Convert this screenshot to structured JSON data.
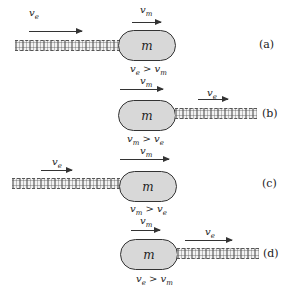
{
  "figure": {
    "mass_label": "m",
    "panels": [
      {
        "id": "a",
        "tag": "(a)",
        "stream_side": "left",
        "ve_label": {
          "base": "v",
          "sub": "e"
        },
        "vm_label": {
          "base": "v",
          "sub": "m"
        },
        "condition": {
          "lhs": "v",
          "lhs_sub": "e",
          "op": ">",
          "rhs": "v",
          "rhs_sub": "m"
        }
      },
      {
        "id": "b",
        "tag": "(b)",
        "stream_side": "right",
        "ve_label": {
          "base": "v",
          "sub": "e"
        },
        "vm_label": {
          "base": "v",
          "sub": "m"
        },
        "condition": {
          "lhs": "v",
          "lhs_sub": "m",
          "op": ">",
          "rhs": "v",
          "rhs_sub": "e"
        }
      },
      {
        "id": "c",
        "tag": "(c)",
        "stream_side": "left",
        "ve_label": {
          "base": "v",
          "sub": "e"
        },
        "vm_label": {
          "base": "v",
          "sub": "m"
        },
        "condition": {
          "lhs": "v",
          "lhs_sub": "m",
          "op": ">",
          "rhs": "v",
          "rhs_sub": "e"
        }
      },
      {
        "id": "d",
        "tag": "(d)",
        "stream_side": "right",
        "ve_label": {
          "base": "v",
          "sub": "e"
        },
        "vm_label": {
          "base": "v",
          "sub": "m"
        },
        "condition": {
          "lhs": "v",
          "lhs_sub": "e",
          "op": ">",
          "rhs": "v",
          "rhs_sub": "m"
        }
      }
    ]
  }
}
